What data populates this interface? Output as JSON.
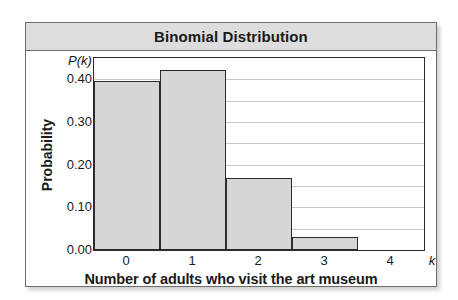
{
  "chart_data": {
    "type": "bar",
    "title": "Binomial Distribution",
    "xlabel": "Number of adults who visit the art museum",
    "ylabel": "Probability",
    "x_axis_symbol": "k",
    "y_axis_symbol": "P(k)",
    "categories": [
      "0",
      "1",
      "2",
      "3",
      "4"
    ],
    "values": [
      0.395,
      0.422,
      0.168,
      0.03,
      0.0
    ],
    "xlim": [
      -0.5,
      4.5
    ],
    "ylim": [
      0.0,
      0.45
    ],
    "y_ticks": [
      "0.00",
      "0.10",
      "0.20",
      "0.30",
      "0.40"
    ],
    "y_tick_values": [
      0.0,
      0.1,
      0.2,
      0.3,
      0.4
    ],
    "gridlines": [
      0.05,
      0.1,
      0.15,
      0.2,
      0.25,
      0.3,
      0.35,
      0.4
    ],
    "grid": true,
    "legend": "none",
    "bar_fill_color": "#d6d6d6",
    "bar_edge_color": "#2b2b2b",
    "title_band_color": "#dddddd",
    "frame_color": "#6e6e6e"
  }
}
